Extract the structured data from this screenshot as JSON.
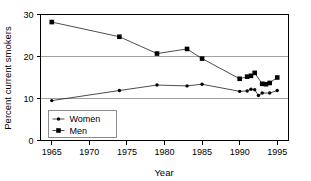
{
  "chart_data": {
    "type": "line",
    "title": "",
    "subtitle": "",
    "xlabel": "Year",
    "ylabel": "Percent current smokers",
    "xlim": [
      1963.5,
      1996.5
    ],
    "ylim": [
      0,
      30
    ],
    "xticks": [
      1965,
      1970,
      1975,
      1980,
      1985,
      1990,
      1995
    ],
    "xtick_labels": [
      "1965",
      "1970",
      "1975",
      "1980",
      "1985",
      "1990",
      "1995"
    ],
    "yticks": [
      0,
      10,
      20,
      30
    ],
    "ytick_labels": [
      "0",
      "10",
      "20",
      "30"
    ],
    "grid": "horizontal",
    "gridlines_at": [
      10,
      20,
      30
    ],
    "legend_position": "lower-left",
    "series": [
      {
        "name": "Women",
        "marker": "small-filled-circle",
        "color": "#000000",
        "x": [
          1965,
          1974,
          1979,
          1983,
          1985,
          1990,
          1991,
          1991.5,
          1992,
          1992.5,
          1993,
          1994,
          1995
        ],
        "values": [
          9.5,
          11.9,
          13.2,
          13.0,
          13.4,
          11.7,
          11.8,
          12.2,
          12.1,
          10.7,
          11.3,
          11.3,
          11.9
        ]
      },
      {
        "name": "Men",
        "marker": "filled-square",
        "color": "#000000",
        "x": [
          1965,
          1974,
          1979,
          1983,
          1985,
          1990,
          1991,
          1991.5,
          1992,
          1993,
          1993.5,
          1994,
          1995
        ],
        "values": [
          28.2,
          24.7,
          20.7,
          21.8,
          19.5,
          14.7,
          15.2,
          15.4,
          16.1,
          13.5,
          13.4,
          13.7,
          15.0
        ]
      }
    ]
  },
  "legend": {
    "entries": [
      {
        "label": "Women"
      },
      {
        "label": "Men"
      }
    ]
  }
}
